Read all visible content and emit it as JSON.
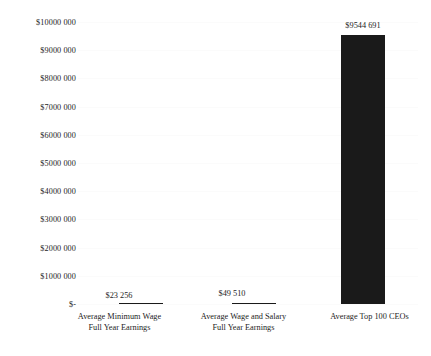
{
  "chart_data": {
    "type": "bar",
    "title": "",
    "subtitle": "",
    "xlabel": "",
    "ylabel": "",
    "categories": [
      "Average Minimum Wage Full Year Earnings",
      "Average Wage and Salary Full Year Earnings",
      "Average Top 100 CEOs"
    ],
    "category_lines": [
      [
        "Average Minimum Wage",
        "Full Year Earnings"
      ],
      [
        "Average Wage and Salary",
        "Full Year Earnings"
      ],
      [
        "Average Top 100 CEOs"
      ]
    ],
    "values": [
      23256,
      49510,
      9544691
    ],
    "value_labels": [
      "$23 256",
      "$49 510",
      "$9544 691"
    ],
    "ylim": [
      0,
      10000000
    ],
    "ytick_values": [
      0,
      1000000,
      2000000,
      3000000,
      4000000,
      5000000,
      6000000,
      7000000,
      8000000,
      9000000,
      10000000
    ],
    "ytick_labels": [
      "$-",
      "$1000 000",
      "$2000 000",
      "$3000 000",
      "$4000 000",
      "$5000 000",
      "$6000 000",
      "$7000 000",
      "$8000 000",
      "$9000 000",
      "$10000 000"
    ],
    "grid": true,
    "legend": false,
    "legend_position": "none",
    "bar_color": "#1a1a1a",
    "background_color": "#ffffff",
    "text_color": "#1d1d1d",
    "gridline_color": "#fbfbfb"
  }
}
